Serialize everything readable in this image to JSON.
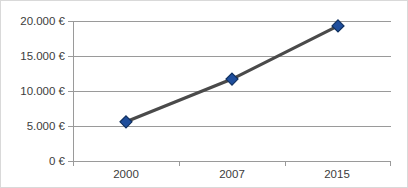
{
  "chart_data": {
    "type": "line",
    "title": "",
    "subtitle": "",
    "xlabel": "",
    "ylabel": "",
    "categories": [
      "2000",
      "2007",
      "2015"
    ],
    "x": [
      2000,
      2007,
      2015
    ],
    "values": [
      5600,
      11700,
      19300
    ],
    "series": [
      {
        "name": "",
        "values": [
          5600,
          11700,
          19300
        ],
        "line_color": "#4a4a4a",
        "marker": "diamond",
        "marker_color": "#1f4e9c",
        "marker_edge_color": "#10305f"
      }
    ],
    "ylim": [
      0,
      20000
    ],
    "ytick_values": [
      0,
      5000,
      10000,
      15000,
      20000
    ],
    "ytick_labels": [
      "0 €",
      "5.000 €",
      "10.000 €",
      "15.000 €",
      "20.000 €"
    ],
    "xtick_labels": [
      "2000",
      "2007",
      "2015"
    ],
    "grid": true,
    "grid_axis": "y",
    "grid_color": "#9a9a9a",
    "legend": false,
    "legend_position": "none",
    "currency_symbol": "€",
    "number_format": "1.234 €",
    "plot_background": "#ffffff",
    "frame_border_color": "#d9d9d9",
    "annotations": []
  },
  "axes": {
    "y": {
      "ticks": [
        {
          "label": "20.000 €",
          "value": 20000
        },
        {
          "label": "15.000 €",
          "value": 15000
        },
        {
          "label": "10.000 €",
          "value": 10000
        },
        {
          "label": "5.000 €",
          "value": 5000
        },
        {
          "label": "0 €",
          "value": 0
        }
      ]
    },
    "x": {
      "ticks": [
        {
          "label": "2000"
        },
        {
          "label": "2007"
        },
        {
          "label": "2015"
        }
      ]
    }
  }
}
